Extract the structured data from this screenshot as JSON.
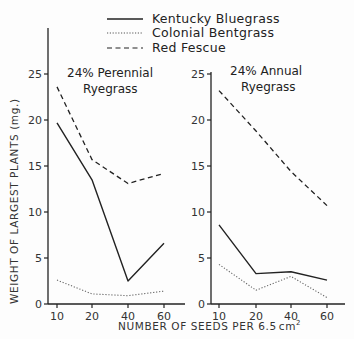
{
  "chart_data": {
    "type": "line",
    "ylabel": "WEIGHT OF LARGEST PLANTS (mg.)",
    "xlabel": "NUMBER OF SEEDS PER 6.5 cm²",
    "xlabel_main": "NUMBER OF SEEDS PER 6.5",
    "xlabel_unit": "cm",
    "xlabel_sup": "2",
    "legend": [
      {
        "name": "Kentucky Bluegrass",
        "style": "solid"
      },
      {
        "name": "Colonial Bentgrass",
        "style": "dotted"
      },
      {
        "name": "Red Fescue",
        "style": "dashed"
      }
    ],
    "legend_position": "top",
    "grid": false,
    "ylim": [
      0,
      25
    ],
    "yticks": [
      "0",
      "5",
      "10",
      "15",
      "20",
      "25"
    ],
    "categories": [
      "10",
      "20",
      "40",
      "60"
    ],
    "panels": [
      {
        "title_line1": "24% Perennial",
        "title_line2": "Ryegrass",
        "series": [
          {
            "name": "Kentucky Bluegrass",
            "values": [
              19.7,
              13.5,
              2.5,
              6.6
            ]
          },
          {
            "name": "Colonial Bentgrass",
            "values": [
              2.6,
              1.1,
              0.9,
              1.4
            ]
          },
          {
            "name": "Red Fescue",
            "values": [
              23.6,
              15.7,
              13.1,
              14.2
            ]
          }
        ]
      },
      {
        "title_line1": "24% Annual",
        "title_line2": "Ryegrass",
        "series": [
          {
            "name": "Kentucky Bluegrass",
            "values": [
              8.6,
              3.3,
              3.5,
              2.6
            ]
          },
          {
            "name": "Colonial Bentgrass",
            "values": [
              4.3,
              1.5,
              3.0,
              0.7
            ]
          },
          {
            "name": "Red Fescue",
            "values": [
              23.2,
              18.8,
              14.4,
              10.7
            ]
          }
        ]
      }
    ]
  }
}
